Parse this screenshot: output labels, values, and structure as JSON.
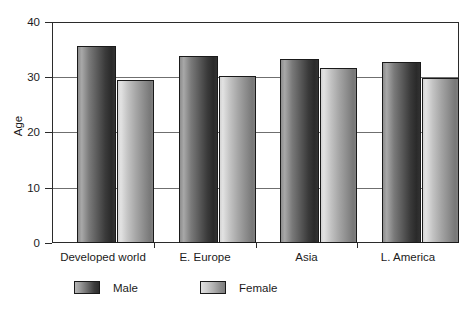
{
  "chart_data": {
    "type": "bar",
    "title": "",
    "xlabel": "",
    "ylabel": "Age",
    "ylim": [
      0,
      40
    ],
    "yticks": [
      0,
      10,
      20,
      30,
      40
    ],
    "grid": true,
    "legend_position": "bottom",
    "categories": [
      "Developed world",
      "E. Europe",
      "Asia",
      "L. America"
    ],
    "series": [
      {
        "name": "Male",
        "values": [
          35.6,
          33.9,
          33.3,
          32.7
        ]
      },
      {
        "name": "Female",
        "values": [
          29.5,
          30.2,
          31.7,
          29.8
        ]
      }
    ]
  },
  "axis": {
    "y_title": "Age",
    "y_tick_labels": [
      "40",
      "30",
      "20",
      "10",
      "0"
    ],
    "x_tick_labels": [
      "Developed world",
      "E. Europe",
      "Asia",
      "L. America"
    ]
  },
  "legend": {
    "items": [
      {
        "label": "Male",
        "swatch": "male-gradient-swatch"
      },
      {
        "label": "Female",
        "swatch": "female-gradient-swatch"
      }
    ]
  },
  "colors": {
    "axis": "#2b2b2b",
    "grid": "#6f6f6f",
    "male_dark": "#2a2a2a",
    "male_light": "#a8a8a8",
    "female_dark": "#787878",
    "female_light": "#e2e2e2",
    "background": "#ffffff",
    "text": "#1b1b1b"
  }
}
